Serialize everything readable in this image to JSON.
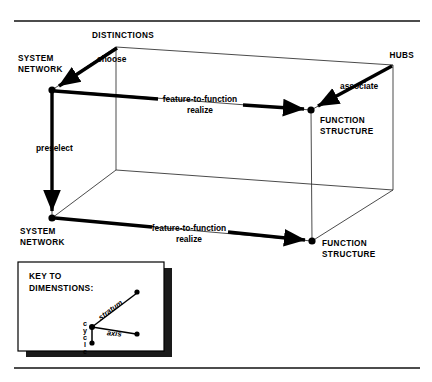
{
  "figure": {
    "background_color": "#ffffff",
    "ink_color": "#000000"
  },
  "rules": {
    "top_rule_label": "top-horizontal-rule",
    "bottom_rule_label": "bottom-horizontal-rule"
  },
  "corners": [
    {
      "id": "top-front-left",
      "label_line1": "SYSTEM",
      "label_line2": "NETWORK"
    },
    {
      "id": "top-back-left",
      "label_line1": "DISTINCTIONS",
      "label_line2": ""
    },
    {
      "id": "top-back-right",
      "label_line1": "HUBS",
      "label_line2": ""
    },
    {
      "id": "top-front-right",
      "label_line1": "FUNCTION",
      "label_line2": "STRUCTURE"
    },
    {
      "id": "bottom-front-left",
      "label_line1": "SYSTEM",
      "label_line2": "NETWORK"
    },
    {
      "id": "bottom-front-right",
      "label_line1": "FUNCTION",
      "label_line2": "STRUCTURE"
    }
  ],
  "relations": [
    {
      "id": "choose",
      "label": "choose"
    },
    {
      "id": "associate",
      "label": "associate"
    },
    {
      "id": "preselect",
      "label": "preselect"
    },
    {
      "id": "realize-upper",
      "label_line1": "feature-to-function",
      "label_line2": "realize"
    },
    {
      "id": "realize-lower",
      "label_line1": "feature-to-function",
      "label_line2": "realize"
    }
  ],
  "key": {
    "title_line1": "KEY TO",
    "title_line2": "DIMENSTIONS:",
    "axes": [
      {
        "id": "stratum",
        "label": "stratum"
      },
      {
        "id": "axis",
        "label": "axis"
      },
      {
        "id": "cycle",
        "label": "cycle",
        "letters": [
          "c",
          "y",
          "c",
          "l",
          "e"
        ]
      }
    ]
  }
}
